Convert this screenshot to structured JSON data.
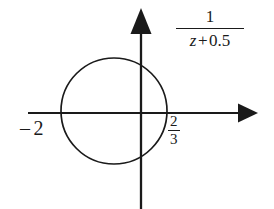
{
  "figure": {
    "name": "pole-zero-unit-circle-plot",
    "background_color": "#ffffff",
    "stroke_color": "#1a1a1a",
    "width": 274,
    "height": 209
  },
  "axes": {
    "horizontal": {
      "name": "real-axis",
      "y": 113,
      "x_start": 28,
      "x_end": 248,
      "arrow": "right"
    },
    "vertical": {
      "name": "imaginary-axis",
      "x": 141,
      "y_start": 8,
      "y_end": 209,
      "arrow": "up"
    },
    "origin": {
      "x": 141,
      "y": 113
    }
  },
  "circle": {
    "name": "region-of-convergence-circle",
    "center_x": 114,
    "center_y": 111,
    "radius": 53,
    "fill": "none",
    "stroke_width": 1.6
  },
  "labels": {
    "left_tick": {
      "minus": "–",
      "value": "2",
      "full": "– 2"
    },
    "right_tick": {
      "numerator": "2",
      "denominator": "3",
      "full": "2/3"
    },
    "transfer_function": {
      "numerator": "1",
      "denominator_variable": "z",
      "denominator_operator": "+",
      "denominator_constant": "0.5",
      "denominator_full": "z + 0.5",
      "full": "1 / (z + 0.5)"
    }
  }
}
